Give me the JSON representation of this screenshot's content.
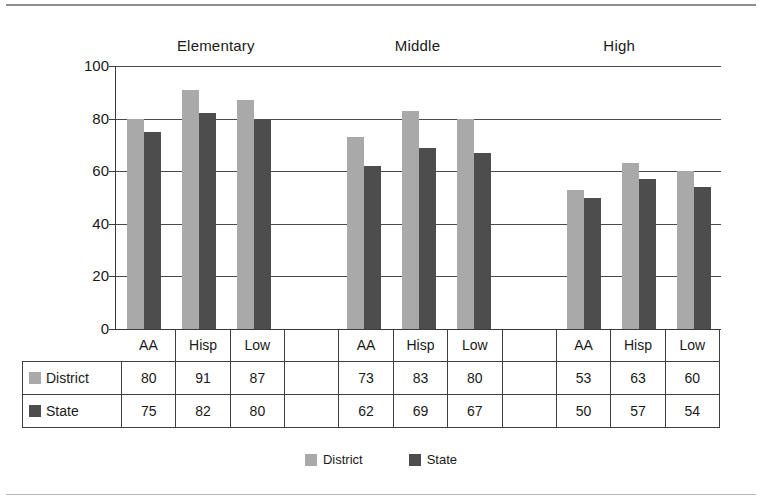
{
  "chart_data": {
    "type": "bar",
    "title": "",
    "xlabel": "",
    "ylabel": "",
    "ylim": [
      0,
      100
    ],
    "yticks": [
      0,
      20,
      40,
      60,
      80,
      100
    ],
    "grid": true,
    "legend_position": "bottom",
    "groups": [
      "Elementary",
      "Middle",
      "High"
    ],
    "categories": [
      "AA",
      "Hisp",
      "Low",
      "AA",
      "Hisp",
      "Low",
      "AA",
      "Hisp",
      "Low"
    ],
    "series": [
      {
        "name": "District",
        "color": "#a9a9a9",
        "values": [
          80,
          91,
          87,
          73,
          83,
          80,
          53,
          63,
          60
        ]
      },
      {
        "name": "State",
        "color": "#4d4d4d",
        "values": [
          75,
          82,
          80,
          62,
          69,
          67,
          50,
          57,
          54
        ]
      }
    ],
    "column_slots": [
      {
        "label": "AA",
        "spacer": false,
        "district": 80,
        "state": 75
      },
      {
        "label": "Hisp",
        "spacer": false,
        "district": 91,
        "state": 82
      },
      {
        "label": "Low",
        "spacer": false,
        "district": 87,
        "state": 80
      },
      {
        "label": "",
        "spacer": true,
        "district": null,
        "state": null
      },
      {
        "label": "AA",
        "spacer": false,
        "district": 73,
        "state": 62
      },
      {
        "label": "Hisp",
        "spacer": false,
        "district": 83,
        "state": 69
      },
      {
        "label": "Low",
        "spacer": false,
        "district": 80,
        "state": 67
      },
      {
        "label": "",
        "spacer": true,
        "district": null,
        "state": null
      },
      {
        "label": "AA",
        "spacer": false,
        "district": 53,
        "state": 50
      },
      {
        "label": "Hisp",
        "spacer": false,
        "district": 63,
        "state": 57
      },
      {
        "label": "Low",
        "spacer": false,
        "district": 60,
        "state": 54
      }
    ],
    "table": {
      "header_cells": [
        "",
        "AA",
        "Hisp",
        "Low",
        "",
        "AA",
        "Hisp",
        "Low",
        "",
        "AA",
        "Hisp",
        "Low"
      ],
      "rows": [
        {
          "label": "District",
          "swatch": "district-swatch",
          "cells": [
            "80",
            "91",
            "87",
            "",
            "73",
            "83",
            "80",
            "",
            "53",
            "63",
            "60"
          ]
        },
        {
          "label": "State",
          "swatch": "state-swatch",
          "cells": [
            "75",
            "82",
            "80",
            "",
            "62",
            "69",
            "67",
            "",
            "50",
            "57",
            "54"
          ]
        }
      ]
    },
    "legend": [
      {
        "label": "District",
        "color": "#a9a9a9"
      },
      {
        "label": "State",
        "color": "#4d4d4d"
      }
    ]
  }
}
